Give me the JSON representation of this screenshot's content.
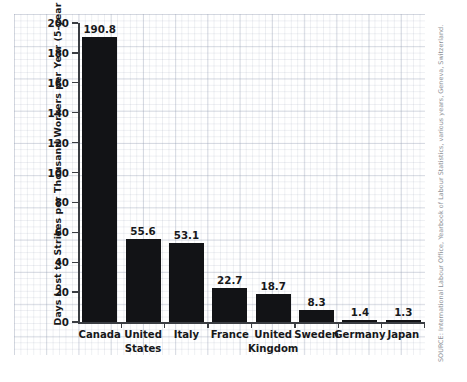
{
  "chart_data": {
    "type": "bar",
    "title": "",
    "xlabel": "",
    "ylabel": "Days Lost to Strikes per Thousand Workers per Year (5-year average)",
    "ylim": [
      0,
      200
    ],
    "yticks": [
      0,
      20,
      40,
      60,
      80,
      100,
      120,
      140,
      160,
      180,
      200
    ],
    "ytick_labels": [
      "0",
      "20",
      "40",
      "60",
      "80",
      "100",
      "120",
      "140",
      "160",
      "180",
      "200"
    ],
    "grid": "graph-paper background, no plot gridlines",
    "legend": "none",
    "categories": [
      "Canada",
      "United States",
      "Italy",
      "France",
      "United Kingdom",
      "Sweden",
      "Germany",
      "Japan"
    ],
    "category_lines": [
      [
        "Canada"
      ],
      [
        "United",
        "States"
      ],
      [
        "Italy"
      ],
      [
        "France"
      ],
      [
        "United",
        "Kingdom"
      ],
      [
        "Sweden"
      ],
      [
        "Germany"
      ],
      [
        "Japan"
      ]
    ],
    "values": [
      190.8,
      55.6,
      53.1,
      22.7,
      18.7,
      8.3,
      1.4,
      1.3
    ],
    "value_labels": [
      "190.8",
      "55.6",
      "53.1",
      "22.7",
      "18.7",
      "8.3",
      "1.4",
      "1.3"
    ],
    "bar_color": "#121316",
    "axis_color": "#3a3d42"
  },
  "source": {
    "text": "SOURCE: International Labour Office, Yearbook of Labour Statistics, various years, Geneva, Switzerland.",
    "color": "#8c8f96"
  }
}
